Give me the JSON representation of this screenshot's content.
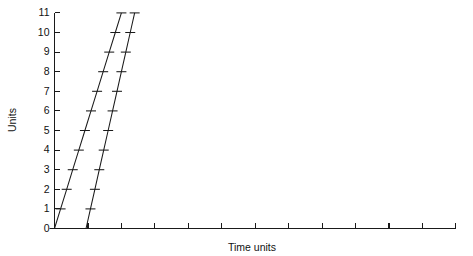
{
  "chart_data": {
    "type": "line",
    "title": "",
    "subtitle": "",
    "xlabel": "Time units",
    "ylabel": "Units",
    "xlim": [
      0,
      12
    ],
    "ylim": [
      0,
      11
    ],
    "grid": false,
    "legend": null,
    "x_tick_labels": [
      "",
      "",
      "",
      "",
      "",
      "",
      "",
      "",
      "",
      "",
      "",
      "",
      ""
    ],
    "x_ticks": [
      0,
      1,
      2,
      3,
      4,
      5,
      6,
      7,
      8,
      9,
      10,
      11,
      12
    ],
    "y_ticks": [
      0,
      1,
      2,
      3,
      4,
      5,
      6,
      7,
      8,
      9,
      10,
      11
    ],
    "y_tick_labels": [
      "0",
      "1",
      "2",
      "3",
      "4",
      "5",
      "6",
      "7",
      "8",
      "9",
      "10",
      "11"
    ],
    "marker_style": "horizontal-dash",
    "line_color": "#1a1a1a",
    "axis_color": "#1a1a1a",
    "background_color": "#ffffff",
    "series": [
      {
        "name": "series-1",
        "x": [
          0.0,
          0.182,
          0.364,
          0.545,
          0.727,
          0.909,
          1.091,
          1.273,
          1.455,
          1.636,
          1.818,
          2.0
        ],
        "values": [
          0,
          1,
          2,
          3,
          4,
          5,
          6,
          7,
          8,
          9,
          10,
          11
        ]
      },
      {
        "name": "series-2",
        "x": [
          0.943,
          1.075,
          1.207,
          1.339,
          1.471,
          1.604,
          1.736,
          1.868,
          2.0,
          2.132,
          2.264,
          2.396
        ],
        "values": [
          0,
          1,
          2,
          3,
          4,
          5,
          6,
          7,
          8,
          9,
          10,
          11
        ]
      }
    ]
  },
  "axes": {
    "x_title": "Time units",
    "y_title": "Units"
  }
}
